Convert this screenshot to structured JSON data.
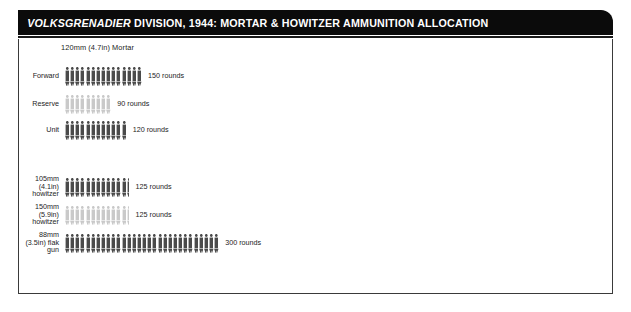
{
  "header": {
    "title_italic": "VOLKSGRENADIER",
    "title_rest": " DIVISION, 1944: MORTAR & HOWITZER AMMUNITION ALLOCATION",
    "background_color": "#0b0b0b",
    "text_color": "#ffffff"
  },
  "legend": {
    "unit_note": "1 figure = 10 rounds",
    "dark_color": "#4a4a4a",
    "light_color": "#c9c9c9"
  },
  "chart_data": {
    "type": "bar",
    "title": "VOLKSGRENADIER DIVISION, 1944: MORTAR & HOWITZER AMMUNITION ALLOCATION",
    "xlabel": "",
    "ylabel": "",
    "units_per_icon": 10,
    "value_unit": "rounds",
    "groups": [
      {
        "name": "120mm (4.7in) Mortar",
        "categories": [
          "Forward",
          "Reserve",
          "Unit"
        ],
        "values": [
          150,
          90,
          120
        ],
        "value_labels": [
          "150 rounds",
          "90 rounds",
          "120 rounds"
        ],
        "shades": [
          "dark",
          "light",
          "dark"
        ],
        "icon_counts": [
          15,
          9,
          12
        ]
      },
      {
        "name": "",
        "categories": [
          "105mm\n(4.1in)\nhowitzer",
          "150mm\n(5.9in)\nhowitzer",
          "88mm\n(3.5in) flak\ngun"
        ],
        "values": [
          125,
          125,
          300
        ],
        "value_labels": [
          "125 rounds",
          "125 rounds",
          "300 rounds"
        ],
        "shades": [
          "dark",
          "light",
          "dark"
        ],
        "icon_counts": [
          12.5,
          12.5,
          30
        ]
      }
    ]
  }
}
